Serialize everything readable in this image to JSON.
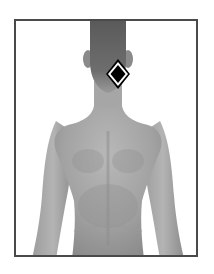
{
  "figure": {
    "view": "posterior",
    "frame_color": "#4a4a4a",
    "background": "#ffffff"
  },
  "marker": {
    "shape": "diamond",
    "location": "upper neck / base of skull",
    "fill": "#000000",
    "inner_border": "#ffffff",
    "outer_border": "#000000"
  }
}
